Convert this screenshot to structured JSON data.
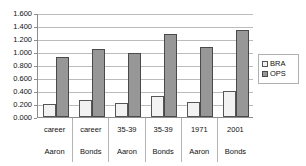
{
  "chart_data": {
    "type": "bar",
    "title": "",
    "xlabel": "",
    "ylabel": "",
    "ylim": [
      0.0,
      1.6
    ],
    "grid": true,
    "legend_position": "right",
    "categories": [
      "career",
      "career",
      "35-39",
      "35-39",
      "1971",
      "2001"
    ],
    "category_sublabels": [
      "Aaron",
      "Bonds",
      "Aaron",
      "Bonds",
      "Aaron",
      "Bonds"
    ],
    "series": [
      {
        "name": "BRA",
        "color": "#f2f2f2",
        "values": [
          0.2,
          0.255,
          0.22,
          0.33,
          0.225,
          0.4
        ]
      },
      {
        "name": "OPS",
        "color": "#979797",
        "values": [
          0.925,
          1.045,
          0.985,
          1.275,
          1.08,
          1.34
        ]
      }
    ],
    "y_ticks": [
      "0.000",
      "0.200",
      "0.400",
      "0.600",
      "0.800",
      "1.000",
      "1.200",
      "1.400",
      "1.600"
    ],
    "y_tick_values": [
      0.0,
      0.2,
      0.4,
      0.6,
      0.8,
      1.0,
      1.2,
      1.4,
      1.6
    ]
  },
  "legend": {
    "items": [
      {
        "label": "BRA"
      },
      {
        "label": "OPS"
      }
    ]
  }
}
